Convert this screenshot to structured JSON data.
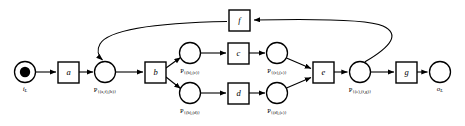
{
  "diagram": {
    "type": "petri-net",
    "colors": {
      "stroke": "#000000",
      "fill": "#ffffff",
      "token": "#000000",
      "background": "#ffffff"
    },
    "places": [
      {
        "id": "i_L",
        "kind": "input-place",
        "label_main": "i",
        "label_sub": "L",
        "cx": 25,
        "cy": 72,
        "r": 10.5,
        "has_token": true,
        "label_x": 25,
        "label_y": 88
      },
      {
        "id": "p_af_b",
        "kind": "place",
        "label_main": "P",
        "label_sub": "{(a,f),(b)}",
        "cx": 105,
        "cy": 72,
        "r": 10.5,
        "has_token": false,
        "label_x": 105,
        "label_y": 89
      },
      {
        "id": "p_b_c",
        "kind": "place",
        "label_main": "P",
        "label_sub": "{(b),(c)}",
        "cx": 190,
        "cy": 53,
        "r": 10.5,
        "has_token": false,
        "label_x": 190,
        "label_y": 70
      },
      {
        "id": "p_b_d",
        "kind": "place",
        "label_main": "P",
        "label_sub": "{(b),(d)}",
        "cx": 190,
        "cy": 93,
        "r": 10.5,
        "has_token": false,
        "label_x": 190,
        "label_y": 110
      },
      {
        "id": "p_c_e",
        "kind": "place",
        "label_main": "P",
        "label_sub": "{(c),(e)}",
        "cx": 277,
        "cy": 53,
        "r": 10.5,
        "has_token": false,
        "label_x": 277,
        "label_y": 70
      },
      {
        "id": "p_d_e",
        "kind": "place",
        "label_main": "P",
        "label_sub": "{(d),(e)}",
        "cx": 277,
        "cy": 93,
        "r": 10.5,
        "has_token": false,
        "label_x": 277,
        "label_y": 110
      },
      {
        "id": "p_e_fg",
        "kind": "place",
        "label_main": "P",
        "label_sub": "{(e),(f,g)}",
        "cx": 360,
        "cy": 72,
        "r": 10.5,
        "has_token": false,
        "label_x": 360,
        "label_y": 89
      },
      {
        "id": "o_L",
        "kind": "output-place",
        "label_main": "o",
        "label_sub": "L",
        "cx": 440,
        "cy": 72,
        "r": 10.5,
        "has_token": false,
        "label_x": 440,
        "label_y": 88
      }
    ],
    "transitions": [
      {
        "id": "a",
        "label": "a",
        "x": 58,
        "y": 62,
        "w": 21,
        "h": 21
      },
      {
        "id": "b",
        "label": "b",
        "x": 145,
        "y": 62,
        "w": 21,
        "h": 21
      },
      {
        "id": "c",
        "label": "c",
        "x": 228,
        "y": 43,
        "w": 21,
        "h": 21
      },
      {
        "id": "d",
        "label": "d",
        "x": 228,
        "y": 83,
        "w": 21,
        "h": 21
      },
      {
        "id": "e",
        "label": "e",
        "x": 313,
        "y": 62,
        "w": 21,
        "h": 21
      },
      {
        "id": "f",
        "label": "f",
        "x": 229,
        "y": 10,
        "w": 21,
        "h": 21
      },
      {
        "id": "g",
        "label": "g",
        "x": 396,
        "y": 62,
        "w": 21,
        "h": 21
      }
    ],
    "arcs": [
      {
        "id": "arc-iL-a",
        "from": "i_L",
        "to": "a",
        "shape": "straight"
      },
      {
        "id": "arc-a-paf",
        "from": "a",
        "to": "p_af_b",
        "shape": "straight"
      },
      {
        "id": "arc-paf-b",
        "from": "p_af_b",
        "to": "b",
        "shape": "straight"
      },
      {
        "id": "arc-b-pbc",
        "from": "b",
        "to": "p_b_c",
        "shape": "straight"
      },
      {
        "id": "arc-b-pbd",
        "from": "b",
        "to": "p_b_d",
        "shape": "straight"
      },
      {
        "id": "arc-pbc-c",
        "from": "p_b_c",
        "to": "c",
        "shape": "straight"
      },
      {
        "id": "arc-pbd-d",
        "from": "p_b_d",
        "to": "d",
        "shape": "straight"
      },
      {
        "id": "arc-c-pce",
        "from": "c",
        "to": "p_c_e",
        "shape": "straight"
      },
      {
        "id": "arc-d-pde",
        "from": "d",
        "to": "p_d_e",
        "shape": "straight"
      },
      {
        "id": "arc-pce-e",
        "from": "p_c_e",
        "to": "e",
        "shape": "straight"
      },
      {
        "id": "arc-pde-e",
        "from": "p_d_e",
        "to": "e",
        "shape": "straight"
      },
      {
        "id": "arc-e-pefg",
        "from": "e",
        "to": "p_e_fg",
        "shape": "straight"
      },
      {
        "id": "arc-pefg-g",
        "from": "p_e_fg",
        "to": "g",
        "shape": "straight"
      },
      {
        "id": "arc-g-oL",
        "from": "g",
        "to": "o_L",
        "shape": "straight"
      },
      {
        "id": "arc-pefg-f",
        "from": "p_e_fg",
        "to": "f",
        "shape": "curved-feedback"
      },
      {
        "id": "arc-f-paf",
        "from": "f",
        "to": "p_af_b",
        "shape": "curved-feedback"
      }
    ]
  }
}
